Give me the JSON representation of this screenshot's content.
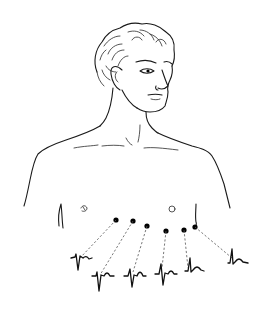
{
  "figure": {
    "background": "#ffffff",
    "ink_color": "#1a1a1a",
    "electrodes": [
      {
        "label": "V1",
        "cx": 116,
        "cy": 220
      },
      {
        "label": "V2",
        "cx": 133,
        "cy": 221
      },
      {
        "label": "V3",
        "cx": 147,
        "cy": 226
      },
      {
        "label": "V4",
        "cx": 166,
        "cy": 231
      },
      {
        "label": "V5",
        "cx": 184,
        "cy": 230
      },
      {
        "label": "V6",
        "cx": 195,
        "cy": 227
      }
    ],
    "traces_count": 6
  }
}
